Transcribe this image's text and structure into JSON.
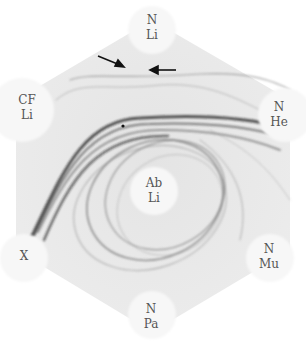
{
  "figure": {
    "labels": [
      {
        "id": "top",
        "line1": "N",
        "line2": "Li",
        "x": 152,
        "y": 26
      },
      {
        "id": "upper-left",
        "line1": "CF",
        "line2": "Li",
        "x": 26,
        "y": 102
      },
      {
        "id": "upper-right",
        "line1": "N",
        "line2": "He",
        "x": 279,
        "y": 108
      },
      {
        "id": "center",
        "line1": "Ab",
        "line2": "Li",
        "x": 154,
        "y": 183
      },
      {
        "id": "left",
        "line1": "X",
        "line2": "",
        "x": 24,
        "y": 255
      },
      {
        "id": "lower-right",
        "line1": "N",
        "line2": "Mu",
        "x": 267,
        "y": 248
      },
      {
        "id": "bottom",
        "line1": "N",
        "line2": "Pa",
        "x": 150,
        "y": 310
      }
    ],
    "arrows": [
      {
        "id": "arrow-left",
        "from": [
          98,
          56
        ],
        "to": [
          122,
          66
        ]
      },
      {
        "id": "arrow-right",
        "from": [
          176,
          69
        ],
        "to": [
          152,
          70
        ]
      }
    ]
  }
}
